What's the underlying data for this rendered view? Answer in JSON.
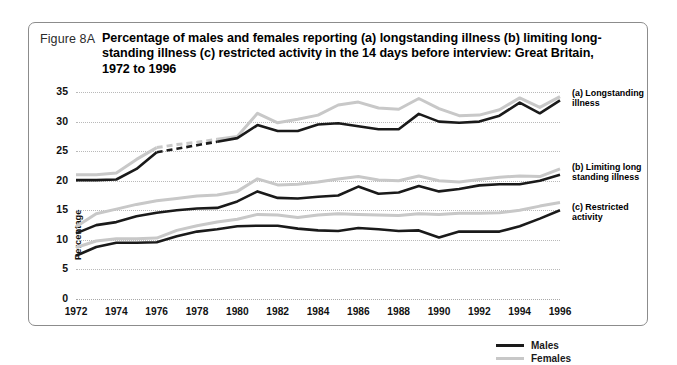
{
  "figure": {
    "label": "Figure 8A",
    "title": "Percentage of males and females reporting (a) longstanding illness  (b) limiting long-standing illness  (c) restricted activity in the 14 days before interview: Great Britain, 1972 to 1996"
  },
  "legend": {
    "males": "Males",
    "females": "Females"
  },
  "annotations": {
    "a": "(a) Longstanding illness",
    "b": "(b) Limiting long standing illness",
    "c": "(c) Restricted activity"
  },
  "colors": {
    "males": "#1a1a1a",
    "females": "#c8c8c8",
    "grid": "#b9b9b9",
    "frame": "#8c8c8c"
  },
  "chart_data": {
    "type": "line",
    "xlabel": "",
    "ylabel": "Percentage",
    "ylim": [
      0,
      35
    ],
    "ytick_step": 5,
    "yticks": [
      0,
      5,
      10,
      15,
      20,
      25,
      30,
      35
    ],
    "xlim": [
      1972,
      1996
    ],
    "xticks": [
      1972,
      1974,
      1976,
      1978,
      1980,
      1982,
      1984,
      1986,
      1988,
      1990,
      1992,
      1994,
      1996
    ],
    "xtick_labels": [
      "1972",
      "1974",
      "1976",
      "1978",
      "1980",
      "1982",
      "1984",
      "1986",
      "1988",
      "1990",
      "1992",
      "1994",
      "1996"
    ],
    "grid": "horizontal-dotted",
    "legend_position": "inside-bottom-right",
    "x": [
      1972,
      1973,
      1974,
      1975,
      1976,
      1977,
      1978,
      1979,
      1980,
      1981,
      1982,
      1983,
      1984,
      1985,
      1986,
      1987,
      1988,
      1989,
      1990,
      1991,
      1992,
      1993,
      1994,
      1995,
      1996
    ],
    "gap_segments": [
      {
        "series": [
          "a-males",
          "a-females"
        ],
        "from": 1976,
        "to": 1979,
        "style": "dashed",
        "note": "no survey data collected"
      }
    ],
    "series": [
      {
        "name": "(a) Longstanding illness - Males",
        "group": "a",
        "sex": "Males",
        "color": "#1a1a1a",
        "values": [
          20.1,
          20.1,
          20.2,
          22.0,
          24.8,
          25.4,
          26.0,
          26.6,
          27.2,
          29.4,
          28.4,
          28.4,
          29.5,
          29.7,
          29.2,
          28.7,
          28.7,
          31.3,
          30.0,
          29.8,
          30.0,
          31.0,
          33.2,
          31.4,
          33.6
        ]
      },
      {
        "name": "(a) Longstanding illness - Females",
        "group": "a",
        "sex": "Females",
        "color": "#c8c8c8",
        "values": [
          21.0,
          21.0,
          21.3,
          23.6,
          25.6,
          26.1,
          26.5,
          27.0,
          27.5,
          31.4,
          29.8,
          30.4,
          31.1,
          32.8,
          33.3,
          32.3,
          32.1,
          33.9,
          32.2,
          31.0,
          31.1,
          32.0,
          34.0,
          32.4,
          34.2
        ]
      },
      {
        "name": "(b) Limiting longstanding illness - Males",
        "group": "b",
        "sex": "Males",
        "color": "#1a1a1a",
        "values": [
          11.1,
          12.5,
          13.0,
          14.0,
          14.6,
          15.0,
          15.3,
          15.4,
          16.5,
          18.2,
          17.1,
          17.0,
          17.3,
          17.5,
          19.0,
          17.8,
          18.0,
          19.1,
          18.2,
          18.6,
          19.2,
          19.4,
          19.4,
          20.0,
          21.0
        ]
      },
      {
        "name": "(b) Limiting longstanding illness - Females",
        "group": "b",
        "sex": "Females",
        "color": "#c8c8c8",
        "values": [
          12.2,
          14.4,
          15.2,
          16.0,
          16.6,
          17.0,
          17.4,
          17.6,
          18.2,
          20.3,
          19.3,
          19.4,
          19.8,
          20.3,
          20.7,
          20.1,
          20.0,
          20.8,
          20.0,
          19.8,
          20.2,
          20.6,
          20.8,
          20.7,
          22.0
        ]
      },
      {
        "name": "(c) Restricted activity - Males",
        "group": "c",
        "sex": "Males",
        "color": "#1a1a1a",
        "values": [
          7.3,
          8.8,
          9.5,
          9.5,
          9.6,
          10.6,
          11.4,
          11.8,
          12.3,
          12.4,
          12.4,
          11.9,
          11.6,
          11.5,
          12.0,
          11.8,
          11.5,
          11.6,
          10.4,
          11.4,
          11.4,
          11.4,
          12.3,
          13.6,
          15.0
        ]
      },
      {
        "name": "(c) Restricted activity - Females",
        "group": "c",
        "sex": "Females",
        "color": "#c8c8c8",
        "values": [
          8.7,
          9.8,
          10.2,
          10.2,
          10.3,
          11.6,
          12.4,
          13.0,
          13.5,
          14.3,
          14.2,
          13.8,
          14.2,
          14.4,
          14.3,
          14.2,
          14.1,
          14.4,
          14.3,
          14.5,
          14.5,
          14.6,
          15.0,
          15.7,
          16.3
        ]
      }
    ]
  }
}
